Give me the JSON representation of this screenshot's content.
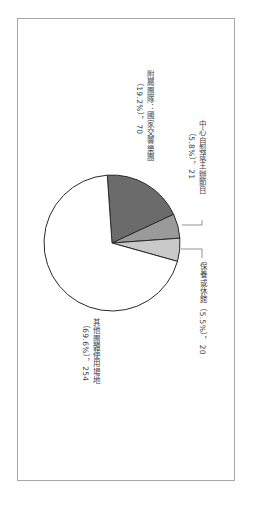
{
  "chart_data": {
    "type": "pie",
    "orientation": "rotated 90deg clockwise",
    "title": "",
    "slices": [
      {
        "label": "附屬團隊：國家交響樂團",
        "percent": 19.2,
        "value": 70,
        "color": "#6b6b6b"
      },
      {
        "label": "中心自製或主辦節目",
        "percent": 5.8,
        "value": 21,
        "color": "#9a9a9a"
      },
      {
        "label": "保養或休館",
        "percent": 5.5,
        "value": 20,
        "color": "#c9c9c9"
      },
      {
        "label": "其他團體使用場地",
        "percent": 69.6,
        "value": 254,
        "color": "#ffffff"
      }
    ],
    "start_angle_deg": -94,
    "direction": "clockwise",
    "total": 365
  },
  "labels": {
    "l1_line1": "附屬團隊：國家交響樂團",
    "l1_line2": "（19.2%），70",
    "l2_line1": "中心自製或主辦節目",
    "l2_line2": "（5.8%），21",
    "l3_line1": "保養或休館（5.5%），20",
    "l4_line1": "其他團體使用場地",
    "l4_line2": "（69.6%），254"
  }
}
